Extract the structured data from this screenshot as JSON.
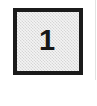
{
  "page": {
    "background_color": "#ffffff",
    "width": 97,
    "height": 106
  },
  "box": {
    "label": "1",
    "border_color": "#1b1b1b",
    "fill_color": "#e6e6e6",
    "text_color": "#171717",
    "border_width_px": 4,
    "x": 13,
    "y": 8,
    "width": 70,
    "height": 67
  },
  "artifacts": {
    "right_rule_color": "#e2e2e2"
  }
}
